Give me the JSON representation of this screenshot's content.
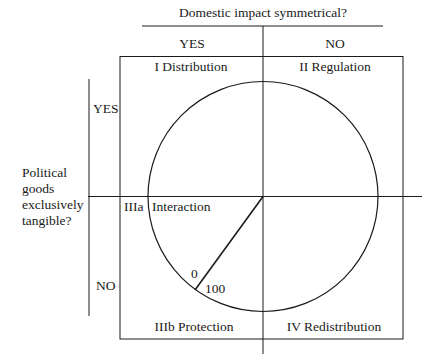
{
  "diagram": {
    "top_axis": {
      "question": "Domestic impact symmetrical?",
      "yes": "YES",
      "no": "NO"
    },
    "left_axis": {
      "question_lines": [
        "Political",
        "goods",
        "exclusively",
        "tangible?"
      ],
      "yes": "YES",
      "no": "NO"
    },
    "quadrants": {
      "top_left": "I Distribution",
      "top_right": "II Regulation",
      "bottom_left": "IIIb Protection",
      "bottom_right": "IV Redistribution",
      "middle_left_tag": "IIIa",
      "middle_left_label": "Interaction"
    },
    "dial": {
      "label_start": "0",
      "label_end": "100"
    },
    "colors": {
      "line": "#1a1a1a",
      "background": "#ffffff"
    }
  }
}
